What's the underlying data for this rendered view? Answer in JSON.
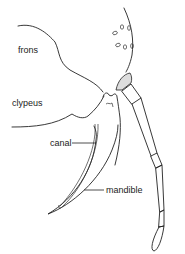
{
  "diagram": {
    "type": "anatomical line drawing",
    "labels": {
      "frons": "frons",
      "clypeus": "clypeus",
      "canal": "canal",
      "mandible": "mandible"
    },
    "colors": {
      "line": "#222222",
      "background": "#ffffff",
      "stipple": "#999999"
    }
  }
}
